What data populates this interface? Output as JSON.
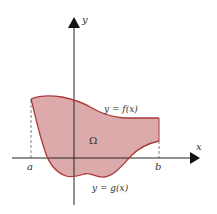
{
  "diagram": {
    "type": "region-between-curves",
    "axes": {
      "x_label": "x",
      "y_label": "y"
    },
    "bounds": {
      "left_label": "a",
      "right_label": "b"
    },
    "curves": {
      "upper_label": "y = f(x)",
      "lower_label": "y = g(x)"
    },
    "region_label": "Ω",
    "colors": {
      "fill": "#dcaaaa",
      "curve": "#a83a3a",
      "axis": "#222222",
      "dashed": "#666666"
    }
  }
}
